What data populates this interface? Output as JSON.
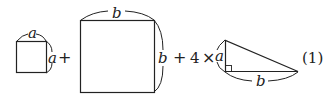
{
  "diagram": {
    "small_square": {
      "top_label": "a",
      "side_label": "a"
    },
    "plus_1": "+",
    "big_square": {
      "top_label": "b",
      "side_label": "b"
    },
    "plus_2": "+",
    "coefficient": "4",
    "times": "×",
    "triangle": {
      "leg_label": "a",
      "base_label": "b",
      "right_angle": true
    },
    "equation_number": "(1)"
  }
}
